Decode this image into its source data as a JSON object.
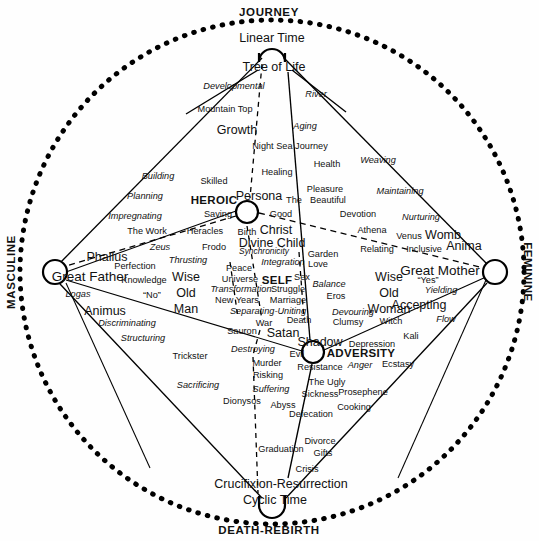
{
  "figure": {
    "type": "diagram",
    "colors": {
      "ink": "#000000",
      "paper": "#ffffff"
    }
  },
  "axes": {
    "top": "JOURNEY",
    "bottom": "DEATH-REBIRTH",
    "left": "MASCULINE",
    "right": "FEMININE"
  },
  "poles": {
    "heroic": "HEROIC",
    "adversity": "ADVERSITY",
    "self": "SELF"
  },
  "nodes": {
    "top_primary": "Linear Time",
    "top_secondary": "Tree of Life",
    "bottom_primary": "Cyclic Time",
    "bottom_secondary": "Crucifixion-Resurrection",
    "left_primary": "Great Father",
    "right_primary": "Great Mother",
    "heroic_node": "Persona",
    "adversity_node": "Shadow",
    "center_node": "SELF"
  },
  "labels": [
    {
      "t": "JOURNEY",
      "x": 269,
      "y": 13,
      "cls": "axis",
      "n": "axis-label-journey"
    },
    {
      "t": "DEATH-REBIRTH",
      "x": 269,
      "y": 531,
      "cls": "axis",
      "n": "axis-label-death-rebirth"
    },
    {
      "t": "MASCULINE",
      "x": 12,
      "y": 272,
      "cls": "axis axis-left",
      "n": "axis-label-masculine"
    },
    {
      "t": "FEMININE",
      "x": 527,
      "y": 272,
      "cls": "axis axis-right",
      "n": "axis-label-feminine"
    },
    {
      "t": "Linear Time",
      "x": 272,
      "y": 38,
      "cls": "n-lg",
      "n": "node-linear-time"
    },
    {
      "t": "Tree of Life",
      "x": 274,
      "y": 67,
      "cls": "n-lg",
      "n": "node-tree-of-life"
    },
    {
      "t": "Developmental",
      "x": 234,
      "y": 87,
      "cls": "n-sm it",
      "n": "label-developmental"
    },
    {
      "t": "River",
      "x": 316,
      "y": 95,
      "cls": "n-sm it",
      "n": "label-river"
    },
    {
      "t": "Mountain Top",
      "x": 225,
      "y": 110,
      "cls": "n-sm",
      "n": "label-mountain-top"
    },
    {
      "t": "Growth",
      "x": 237,
      "y": 130,
      "cls": "n-lg",
      "n": "label-growth"
    },
    {
      "t": "Aging",
      "x": 305,
      "y": 127,
      "cls": "n-sm it",
      "n": "label-aging"
    },
    {
      "t": "Night Sea Journey",
      "x": 290,
      "y": 147,
      "cls": "n-sm",
      "n": "label-night-sea-journey"
    },
    {
      "t": "Health",
      "x": 327,
      "y": 165,
      "cls": "n-sm",
      "n": "label-health"
    },
    {
      "t": "Weaving",
      "x": 378,
      "y": 161,
      "cls": "n-sm it",
      "n": "label-weaving"
    },
    {
      "t": "Healing",
      "x": 277,
      "y": 173,
      "cls": "n-sm",
      "n": "label-healing"
    },
    {
      "t": "Building",
      "x": 158,
      "y": 177,
      "cls": "n-sm it",
      "n": "label-building"
    },
    {
      "t": "Skilled",
      "x": 214,
      "y": 182,
      "cls": "n-sm",
      "n": "label-skilled"
    },
    {
      "t": "Pleasure",
      "x": 325,
      "y": 190,
      "cls": "n-sm",
      "n": "label-pleasure"
    },
    {
      "t": "Maintaining",
      "x": 400,
      "y": 192,
      "cls": "n-sm it",
      "n": "label-maintaining"
    },
    {
      "t": "Planning",
      "x": 145,
      "y": 197,
      "cls": "n-sm it",
      "n": "label-planning"
    },
    {
      "t": "HEROIC",
      "x": 214,
      "y": 201,
      "cls": "pole",
      "n": "pole-heroic"
    },
    {
      "t": "Persona",
      "x": 259,
      "y": 196,
      "cls": "n-lg",
      "n": "node-persona"
    },
    {
      "t": "The",
      "x": 294,
      "y": 201,
      "cls": "n-sm",
      "n": "label-the"
    },
    {
      "t": "Beautiful",
      "x": 328,
      "y": 201,
      "cls": "n-sm",
      "n": "label-beautiful"
    },
    {
      "t": "Impregnating",
      "x": 135,
      "y": 217,
      "cls": "n-sm it",
      "n": "label-impregnating"
    },
    {
      "t": "Saving",
      "x": 218,
      "y": 215,
      "cls": "n-sm",
      "n": "label-saving"
    },
    {
      "t": "Good",
      "x": 281,
      "y": 215,
      "cls": "n-sm",
      "n": "label-good"
    },
    {
      "t": "Devotion",
      "x": 358,
      "y": 215,
      "cls": "n-sm",
      "n": "label-devotion"
    },
    {
      "t": "Nurturing",
      "x": 421,
      "y": 218,
      "cls": "n-sm it",
      "n": "label-nurturing"
    },
    {
      "t": "The Work",
      "x": 147,
      "y": 232,
      "cls": "n-sm",
      "n": "label-the-work"
    },
    {
      "t": "Heracles",
      "x": 205,
      "y": 232,
      "cls": "n-sm",
      "n": "label-heracles"
    },
    {
      "t": "Birth",
      "x": 247,
      "y": 233,
      "cls": "n-sm",
      "n": "label-birth"
    },
    {
      "t": "Christ",
      "x": 276,
      "y": 230,
      "cls": "n-lg",
      "n": "label-christ"
    },
    {
      "t": "Athena",
      "x": 372,
      "y": 231,
      "cls": "n-sm",
      "n": "label-athena"
    },
    {
      "t": "Venus",
      "x": 409,
      "y": 237,
      "cls": "n-sm",
      "n": "label-venus"
    },
    {
      "t": "Womb",
      "x": 443,
      "y": 235,
      "cls": "n-lg",
      "n": "label-womb"
    },
    {
      "t": "Zeus",
      "x": 160,
      "y": 248,
      "cls": "n-sm it",
      "n": "label-zeus"
    },
    {
      "t": "Frodo",
      "x": 214,
      "y": 248,
      "cls": "n-sm",
      "n": "label-frodo"
    },
    {
      "t": "Divine Child",
      "x": 272,
      "y": 243,
      "cls": "n-lg",
      "n": "label-divine-child"
    },
    {
      "t": "Synchronicity",
      "x": 264,
      "y": 251,
      "cls": "n-xs it",
      "n": "label-synchronicity"
    },
    {
      "t": "Relating",
      "x": 377,
      "y": 250,
      "cls": "n-sm",
      "n": "label-relating"
    },
    {
      "t": "Inclusive",
      "x": 424,
      "y": 250,
      "cls": "n-sm",
      "n": "label-inclusive"
    },
    {
      "t": "Anima",
      "x": 464,
      "y": 246,
      "cls": "n-lg",
      "n": "label-anima"
    },
    {
      "t": "Phallus",
      "x": 107,
      "y": 257,
      "cls": "n-lg",
      "n": "label-phallus"
    },
    {
      "t": "Thrusting",
      "x": 188,
      "y": 261,
      "cls": "n-sm it",
      "n": "label-thrusting"
    },
    {
      "t": "Garden",
      "x": 323,
      "y": 255,
      "cls": "n-sm",
      "n": "label-garden"
    },
    {
      "t": "Integration",
      "x": 283,
      "y": 263,
      "cls": "n-sm it",
      "n": "label-integration"
    },
    {
      "t": "Love",
      "x": 318,
      "y": 265,
      "cls": "n-sm",
      "n": "label-love"
    },
    {
      "t": "Perfection",
      "x": 135,
      "y": 267,
      "cls": "n-sm",
      "n": "label-perfection"
    },
    {
      "t": "Peace",
      "x": 239,
      "y": 269,
      "cls": "n-sm",
      "n": "label-peace"
    },
    {
      "t": "Wise",
      "x": 186,
      "y": 277,
      "cls": "n-lg",
      "n": "label-wise-old-man-1"
    },
    {
      "t": "Old",
      "x": 186,
      "y": 293,
      "cls": "n-lg",
      "n": "label-wise-old-man-2"
    },
    {
      "t": "Man",
      "x": 186,
      "y": 309,
      "cls": "n-lg",
      "n": "label-wise-old-man-3"
    },
    {
      "t": "Wise",
      "x": 389,
      "y": 277,
      "cls": "n-lg",
      "n": "label-wise-old-woman-1"
    },
    {
      "t": "Old",
      "x": 389,
      "y": 293,
      "cls": "n-lg",
      "n": "label-wise-old-woman-2"
    },
    {
      "t": "Woman",
      "x": 389,
      "y": 309,
      "cls": "n-lg",
      "n": "label-wise-old-woman-3"
    },
    {
      "t": "Great Father",
      "x": 90,
      "y": 277,
      "cls": "n-xl",
      "n": "node-great-father"
    },
    {
      "t": "Great Mother",
      "x": 440,
      "y": 271,
      "cls": "n-xl",
      "n": "node-great-mother"
    },
    {
      "t": "Knowledge",
      "x": 144,
      "y": 281,
      "cls": "n-sm",
      "n": "label-knowledge"
    },
    {
      "t": "Universe",
      "x": 240,
      "y": 280,
      "cls": "n-sm",
      "n": "label-universe"
    },
    {
      "t": "SELF",
      "x": 277,
      "y": 281,
      "cls": "pole",
      "n": "pole-self"
    },
    {
      "t": "Sex",
      "x": 302,
      "y": 278,
      "cls": "n-sm",
      "n": "label-sex"
    },
    {
      "t": "Balance",
      "x": 329,
      "y": 285,
      "cls": "n-sm it",
      "n": "label-balance"
    },
    {
      "t": "“Yes”",
      "x": 428,
      "y": 281,
      "cls": "n-sm",
      "n": "label-yes"
    },
    {
      "t": "“No”",
      "x": 152,
      "y": 296,
      "cls": "n-sm",
      "n": "label-no"
    },
    {
      "t": "Transformation",
      "x": 241,
      "y": 290,
      "cls": "n-sm it",
      "n": "label-transformation"
    },
    {
      "t": "Struggle",
      "x": 288,
      "y": 290,
      "cls": "n-sm",
      "n": "label-struggle"
    },
    {
      "t": "Eros",
      "x": 336,
      "y": 297,
      "cls": "n-sm",
      "n": "label-eros"
    },
    {
      "t": "Yielding",
      "x": 441,
      "y": 291,
      "cls": "n-sm it",
      "n": "label-yielding"
    },
    {
      "t": "Logas",
      "x": 78,
      "y": 295,
      "cls": "n-sm it",
      "n": "label-logas"
    },
    {
      "t": "New Years",
      "x": 237,
      "y": 301,
      "cls": "n-sm",
      "n": "label-new-years"
    },
    {
      "t": "Marriage",
      "x": 288,
      "y": 301,
      "cls": "n-sm",
      "n": "label-marriage"
    },
    {
      "t": "Animus",
      "x": 105,
      "y": 311,
      "cls": "n-lg",
      "n": "label-animus"
    },
    {
      "t": "Accepting",
      "x": 419,
      "y": 305,
      "cls": "n-lg",
      "n": "label-accepting"
    },
    {
      "t": "Separating-Uniting",
      "x": 268,
      "y": 312,
      "cls": "n-sm it",
      "n": "label-separating-uniting"
    },
    {
      "t": "Devouring",
      "x": 353,
      "y": 313,
      "cls": "n-sm it",
      "n": "label-devouring"
    },
    {
      "t": "Discriminating",
      "x": 127,
      "y": 324,
      "cls": "n-sm it",
      "n": "label-discriminating"
    },
    {
      "t": "War",
      "x": 264,
      "y": 324,
      "cls": "n-sm",
      "n": "label-war"
    },
    {
      "t": "Death",
      "x": 299,
      "y": 321,
      "cls": "n-sm",
      "n": "label-death"
    },
    {
      "t": "Clumsy",
      "x": 348,
      "y": 323,
      "cls": "n-sm",
      "n": "label-clumsy"
    },
    {
      "t": "Witch",
      "x": 391,
      "y": 322,
      "cls": "n-sm",
      "n": "label-witch"
    },
    {
      "t": "Flow",
      "x": 446,
      "y": 320,
      "cls": "n-sm it",
      "n": "label-flow"
    },
    {
      "t": "Satan",
      "x": 283,
      "y": 333,
      "cls": "n-lg",
      "n": "label-satan"
    },
    {
      "t": "Sauron",
      "x": 242,
      "y": 332,
      "cls": "n-sm",
      "n": "label-sauron"
    },
    {
      "t": "Kali",
      "x": 411,
      "y": 337,
      "cls": "n-sm",
      "n": "label-kali"
    },
    {
      "t": "Structuring",
      "x": 143,
      "y": 339,
      "cls": "n-sm it",
      "n": "label-structuring"
    },
    {
      "t": "Shadow",
      "x": 320,
      "y": 342,
      "cls": "n-lg",
      "n": "node-shadow"
    },
    {
      "t": "Depression",
      "x": 372,
      "y": 345,
      "cls": "n-sm",
      "n": "label-depression"
    },
    {
      "t": "Destroying",
      "x": 253,
      "y": 350,
      "cls": "n-sm it",
      "n": "label-destroying"
    },
    {
      "t": "Trickster",
      "x": 190,
      "y": 357,
      "cls": "n-sm",
      "n": "label-trickster"
    },
    {
      "t": "Evil",
      "x": 297,
      "y": 355,
      "cls": "n-sm",
      "n": "label-evil"
    },
    {
      "t": "ADVERSITY",
      "x": 361,
      "y": 354,
      "cls": "pole",
      "n": "pole-adversity"
    },
    {
      "t": "Murder",
      "x": 267,
      "y": 364,
      "cls": "n-sm",
      "n": "label-murder"
    },
    {
      "t": "Resistance",
      "x": 320,
      "y": 368,
      "cls": "n-sm",
      "n": "label-resistance"
    },
    {
      "t": "Anger",
      "x": 360,
      "y": 366,
      "cls": "n-sm it",
      "n": "label-anger"
    },
    {
      "t": "Ecstasy",
      "x": 398,
      "y": 365,
      "cls": "n-sm",
      "n": "label-ecstasy"
    },
    {
      "t": "Risking",
      "x": 268,
      "y": 376,
      "cls": "n-sm",
      "n": "label-risking"
    },
    {
      "t": "The Ugly",
      "x": 327,
      "y": 383,
      "cls": "n-sm",
      "n": "label-the-ugly"
    },
    {
      "t": "Sacrificing",
      "x": 198,
      "y": 386,
      "cls": "n-sm it",
      "n": "label-sacrificing"
    },
    {
      "t": "Suffering",
      "x": 271,
      "y": 390,
      "cls": "n-sm it",
      "n": "label-suffering"
    },
    {
      "t": "Sickness",
      "x": 320,
      "y": 395,
      "cls": "n-sm",
      "n": "label-sickness"
    },
    {
      "t": "Prosephene",
      "x": 363,
      "y": 393,
      "cls": "n-sm",
      "n": "label-prosephene"
    },
    {
      "t": "Dionysos",
      "x": 242,
      "y": 402,
      "cls": "n-sm",
      "n": "label-dionysos"
    },
    {
      "t": "Abyss",
      "x": 283,
      "y": 406,
      "cls": "n-sm",
      "n": "label-abyss"
    },
    {
      "t": "Cooking",
      "x": 354,
      "y": 408,
      "cls": "n-sm",
      "n": "label-cooking"
    },
    {
      "t": "Defecation",
      "x": 311,
      "y": 415,
      "cls": "n-sm",
      "n": "label-defecation"
    },
    {
      "t": "Divorce",
      "x": 320,
      "y": 442,
      "cls": "n-sm",
      "n": "label-divorce"
    },
    {
      "t": "Graduation",
      "x": 281,
      "y": 450,
      "cls": "n-sm",
      "n": "label-graduation"
    },
    {
      "t": "Gifts",
      "x": 323,
      "y": 454,
      "cls": "n-sm",
      "n": "label-gifts"
    },
    {
      "t": "Crisis",
      "x": 307,
      "y": 470,
      "cls": "n-sm",
      "n": "label-crisis"
    },
    {
      "t": "Crucifixion-Resurrection",
      "x": 281,
      "y": 484,
      "cls": "n-lg",
      "n": "node-crucifixion-resurrection"
    },
    {
      "t": "Cyclic Time",
      "x": 275,
      "y": 500,
      "cls": "n-lg",
      "n": "node-cyclic-time"
    }
  ],
  "geometry": {
    "center": {
      "x": 272,
      "y": 272
    },
    "outer_circle_radius": 252,
    "node_points": {
      "top": {
        "x": 272,
        "y": 42
      },
      "bottom": {
        "x": 272,
        "y": 512
      },
      "left": {
        "x": 55,
        "y": 272
      },
      "right": {
        "x": 495,
        "y": 272
      },
      "heroic": {
        "x": 247,
        "y": 212
      },
      "shadow": {
        "x": 313,
        "y": 352
      }
    }
  }
}
